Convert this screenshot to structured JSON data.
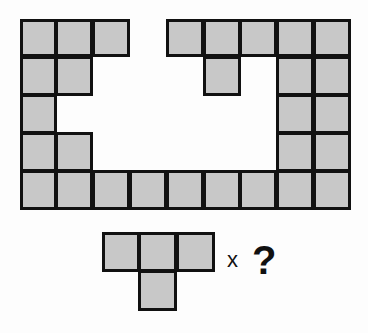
{
  "puzzle": {
    "grid": {
      "cols": 9,
      "rows": 5,
      "cell_w": 36.8,
      "cell_h": 38.2,
      "cells": [
        [
          1,
          1,
          1,
          0,
          1,
          1,
          1,
          1,
          1
        ],
        [
          1,
          1,
          0,
          0,
          0,
          1,
          0,
          1,
          1
        ],
        [
          1,
          0,
          0,
          0,
          0,
          0,
          0,
          1,
          1
        ],
        [
          1,
          1,
          0,
          0,
          0,
          0,
          0,
          1,
          1
        ],
        [
          1,
          1,
          1,
          1,
          1,
          1,
          1,
          1,
          1
        ]
      ]
    },
    "piece": {
      "name": "T-tetromino",
      "cells": [
        [
          1,
          1,
          1
        ],
        [
          0,
          1,
          0
        ]
      ],
      "cell_w": 37.7,
      "cell_h": 39.5
    },
    "multiplier_label": "x",
    "question_label": "?",
    "colors": {
      "fill": "#c8c8c8",
      "stroke": "#111111",
      "background": "#fdfdfd"
    }
  }
}
